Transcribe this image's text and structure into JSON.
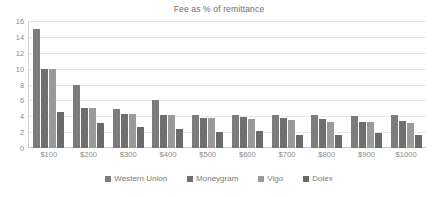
{
  "chart_data": {
    "type": "bar",
    "title": "Fee as % of remittance",
    "xlabel": "",
    "ylabel": "",
    "ylim": [
      0,
      16
    ],
    "yticks": [
      16,
      14,
      12,
      10,
      8,
      6,
      4,
      2,
      0
    ],
    "grid": true,
    "legend_position": "bottom",
    "categories": [
      "$100",
      "$200",
      "$300",
      "$400",
      "$500",
      "$600",
      "$700",
      "$800",
      "$900",
      "$1000"
    ],
    "series": [
      {
        "name": "Western Union",
        "color": "#7c7c7c",
        "values": [
          15.0,
          8.0,
          4.9,
          6.0,
          4.1,
          4.2,
          4.2,
          4.2,
          4.0,
          4.2
        ]
      },
      {
        "name": "Moneygram",
        "color": "#6f6f6f",
        "values": [
          10.0,
          5.0,
          4.3,
          4.2,
          3.8,
          3.9,
          3.8,
          3.6,
          3.3,
          3.4
        ]
      },
      {
        "name": "Vigo",
        "color": "#9a9a9a",
        "values": [
          10.0,
          5.0,
          4.3,
          4.2,
          3.8,
          3.7,
          3.5,
          3.3,
          3.3,
          3.2
        ]
      },
      {
        "name": "Dolex",
        "color": "#6a6a6a",
        "values": [
          4.5,
          3.2,
          2.6,
          2.4,
          2.0,
          2.2,
          1.6,
          1.6,
          1.9,
          1.7
        ]
      }
    ]
  }
}
